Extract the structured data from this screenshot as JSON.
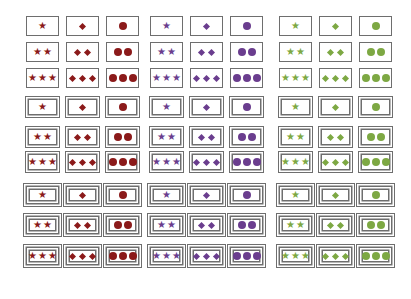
{
  "colors": {
    "red": "#8b1a1a",
    "purple": "#6a3d8e",
    "green": "#7da843",
    "border": "#6e6e6e"
  },
  "columns": [
    {
      "x": 26,
      "color": "red",
      "shape": "star"
    },
    {
      "x": 66,
      "color": "red",
      "shape": "diamond"
    },
    {
      "x": 106,
      "color": "red",
      "shape": "oval"
    },
    {
      "x": 150,
      "color": "purple",
      "shape": "star"
    },
    {
      "x": 190,
      "color": "purple",
      "shape": "diamond"
    },
    {
      "x": 230,
      "color": "purple",
      "shape": "oval"
    },
    {
      "x": 279,
      "color": "green",
      "shape": "star"
    },
    {
      "x": 319,
      "color": "green",
      "shape": "diamond"
    },
    {
      "x": 359,
      "color": "green",
      "shape": "oval"
    }
  ],
  "rows": [
    {
      "y": 16,
      "h": 20,
      "count": 1,
      "border": "single"
    },
    {
      "y": 42,
      "h": 20,
      "count": 2,
      "border": "single"
    },
    {
      "y": 68,
      "h": 20,
      "count": 3,
      "border": "single"
    },
    {
      "y": 96,
      "h": 22,
      "count": 1,
      "border": "double"
    },
    {
      "y": 126,
      "h": 22,
      "count": 2,
      "border": "double"
    },
    {
      "y": 151,
      "h": 22,
      "count": 3,
      "border": "double"
    },
    {
      "y": 183,
      "h": 24,
      "count": 1,
      "border": "triple"
    },
    {
      "y": 213,
      "h": 24,
      "count": 2,
      "border": "triple"
    },
    {
      "y": 244,
      "h": 24,
      "count": 3,
      "border": "triple"
    }
  ],
  "symbols": {
    "star": "★",
    "diamond": "",
    "oval": ""
  },
  "card_width": 33
}
